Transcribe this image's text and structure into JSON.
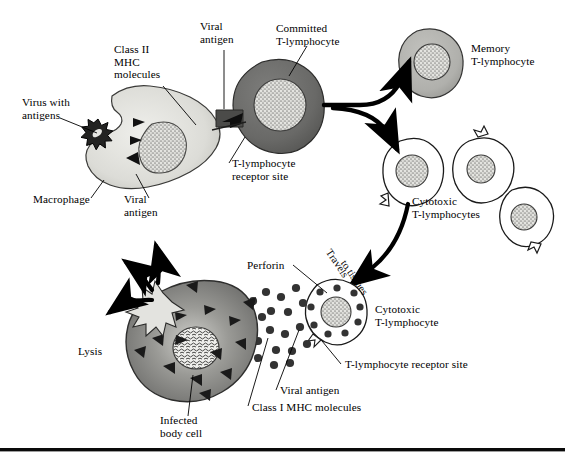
{
  "figure": {
    "background_color": "#ffffff",
    "ink_color": "#000000",
    "palette": {
      "macrophage_fill": "#d9d9d4",
      "committed_tcell_fill": "#6e6e6e",
      "memory_tcell_fill": "#b3b3b3",
      "cytotoxic_tcell_fill": "#ffffff",
      "infected_cell_fill": "#7a7a7a",
      "nucleus_stipple": "#d0d0cc",
      "perforin_dot": "#3c3c3c",
      "virus_fill": "#2b2b2b"
    }
  },
  "labels": {
    "virus_with_antigens": "Virus with\nantigens",
    "class_ii_mhc": "Class II\nMHC\nmolecules",
    "viral_antigen_top": "Viral\nantigen",
    "committed_tlymphocyte": "Committed\nT-lymphocyte",
    "memory_tlymphocyte": "Memory\nT-lymphocyte",
    "macrophage": "Macrophage",
    "viral_antigen_macrophage": "Viral\nantigen",
    "tlymphocyte_receptor_site_top": "T-lymphocyte\nreceptor site",
    "cytotoxic_tlymphocytes": "Cytotoxic\nT-lymphocytes",
    "travels_to_tissues_1": "Travels",
    "travels_to_tissues_2": "to tissues",
    "perforin": "Perforin",
    "cytotoxic_tlymphocyte_single": "Cytotoxic\nT-lymphocyte",
    "tlymphocyte_receptor_site_bottom": "T-lymphocyte receptor site",
    "viral_antigen_bottom": "Viral antigen",
    "class_i_mhc": "Class I MHC molecules",
    "lysis": "Lysis",
    "infected_body_cell": "Infected\nbody cell"
  },
  "cells": [
    {
      "name": "macrophage",
      "kind": "antigen-presenting cell",
      "fill": "#d9d9d4"
    },
    {
      "name": "committed-t-lymphocyte",
      "kind": "activated T cell",
      "fill": "#6e6e6e"
    },
    {
      "name": "memory-t-lymphocyte",
      "kind": "memory T cell",
      "fill": "#b3b3b3"
    },
    {
      "name": "cytotoxic-t-lymphocyte-1",
      "kind": "cytotoxic T cell",
      "fill": "#ffffff"
    },
    {
      "name": "cytotoxic-t-lymphocyte-2",
      "kind": "cytotoxic T cell",
      "fill": "#ffffff"
    },
    {
      "name": "cytotoxic-t-lymphocyte-3",
      "kind": "cytotoxic T cell",
      "fill": "#ffffff"
    },
    {
      "name": "cytotoxic-t-lymphocyte-effector",
      "kind": "cytotoxic T cell",
      "fill": "#ffffff"
    },
    {
      "name": "infected-body-cell",
      "kind": "target cell",
      "fill": "#7a7a7a"
    }
  ],
  "counts": {
    "perforin_granules": 28,
    "class_i_mhc_triangles": 14,
    "class_ii_mhc_triangles": 3,
    "lysis_arrows": 3,
    "cytotoxic_cluster_cells": 3
  }
}
